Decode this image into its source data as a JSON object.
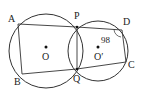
{
  "diagram": {
    "type": "geometry",
    "circles": [
      {
        "name": "O",
        "label": "O",
        "cx": 46,
        "cy": 51,
        "r": 37
      },
      {
        "name": "O'",
        "label": "O′",
        "cx": 98,
        "cy": 51,
        "r": 30
      }
    ],
    "points": {
      "A": {
        "label": "A",
        "x": 18,
        "y": 24
      },
      "B": {
        "label": "B",
        "x": 22,
        "y": 74
      },
      "P": {
        "label": "P",
        "x": 77,
        "y": 27
      },
      "Q": {
        "label": "Q",
        "x": 77,
        "y": 69
      },
      "D": {
        "label": "D",
        "x": 122,
        "y": 30
      },
      "C": {
        "label": "C",
        "x": 126,
        "y": 62
      }
    },
    "angle_label": "98°",
    "angle_text": "98"
  }
}
